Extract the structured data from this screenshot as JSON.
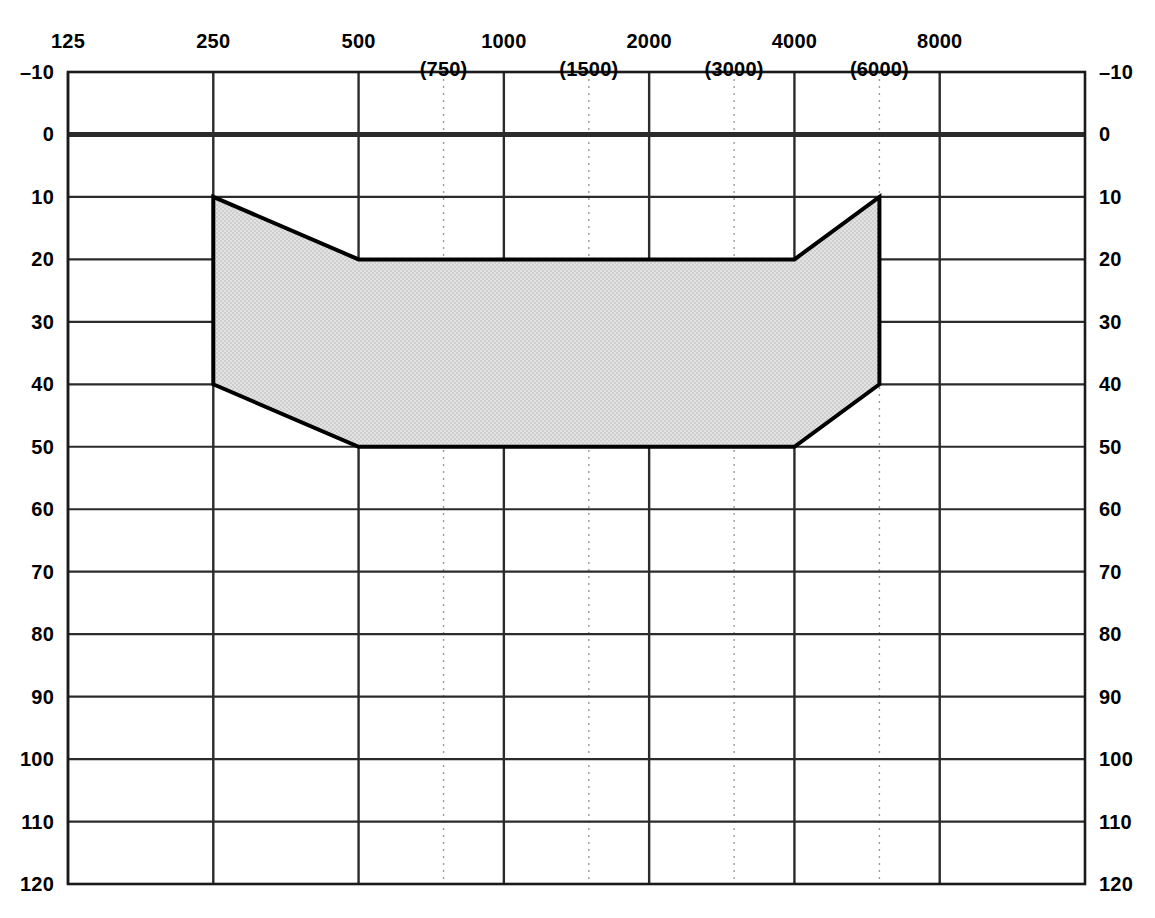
{
  "chart_data": {
    "type": "area",
    "title": "",
    "subtitle": "",
    "xlabel": "",
    "ylabel": "",
    "grid": true,
    "legend": null,
    "x_scale": "log-octave",
    "xlim": [
      125,
      11314
    ],
    "ylim": [
      -10,
      120
    ],
    "y_inverted": true,
    "x_major_ticks": [
      {
        "value": 125,
        "label": "125"
      },
      {
        "value": 250,
        "label": "250"
      },
      {
        "value": 500,
        "label": "500"
      },
      {
        "value": 1000,
        "label": "1000"
      },
      {
        "value": 2000,
        "label": "2000"
      },
      {
        "value": 4000,
        "label": "4000"
      },
      {
        "value": 8000,
        "label": "8000"
      }
    ],
    "x_minor_ticks": [
      {
        "value": 750,
        "label": "(750)"
      },
      {
        "value": 1500,
        "label": "(1500)"
      },
      {
        "value": 3000,
        "label": "(3000)"
      },
      {
        "value": 6000,
        "label": "(6000)"
      }
    ],
    "y_ticks_left": [
      "-10",
      "0",
      "10",
      "20",
      "30",
      "40",
      "50",
      "60",
      "70",
      "80",
      "90",
      "100",
      "110",
      "120"
    ],
    "y_ticks_right": [
      "-10",
      "0",
      "10",
      "20",
      "30",
      "40",
      "50",
      "60",
      "70",
      "80",
      "90",
      "100",
      "110",
      "120"
    ],
    "y_tick_values": [
      -10,
      0,
      10,
      20,
      30,
      40,
      50,
      60,
      70,
      80,
      90,
      100,
      110,
      120
    ],
    "emphasized_y_gridline": 0,
    "series": [
      {
        "name": "shaded-hearing-loss-region",
        "kind": "filled-polygon",
        "fill": "#dadada",
        "stroke": "#000000",
        "stroke_width": 4,
        "upper_boundary": [
          {
            "frequency": 250,
            "level": 10
          },
          {
            "frequency": 500,
            "level": 20
          },
          {
            "frequency": 4000,
            "level": 20
          },
          {
            "frequency": 6000,
            "level": 10
          }
        ],
        "lower_boundary": [
          {
            "frequency": 250,
            "level": 40
          },
          {
            "frequency": 500,
            "level": 50
          },
          {
            "frequency": 4000,
            "level": 50
          },
          {
            "frequency": 6000,
            "level": 40
          }
        ],
        "vertices": [
          {
            "frequency": 250,
            "level": 10
          },
          {
            "frequency": 500,
            "level": 20
          },
          {
            "frequency": 4000,
            "level": 20
          },
          {
            "frequency": 6000,
            "level": 10
          },
          {
            "frequency": 6000,
            "level": 40
          },
          {
            "frequency": 4000,
            "level": 50
          },
          {
            "frequency": 500,
            "level": 50
          },
          {
            "frequency": 250,
            "level": 40
          }
        ]
      }
    ],
    "colors": {
      "axis": "#1a1a1a",
      "gridline": "#2b2b2b",
      "minor_gridline": "#9a9a9a",
      "region_fill": "#dadada",
      "region_stroke": "#000000",
      "background": "#ffffff"
    }
  }
}
